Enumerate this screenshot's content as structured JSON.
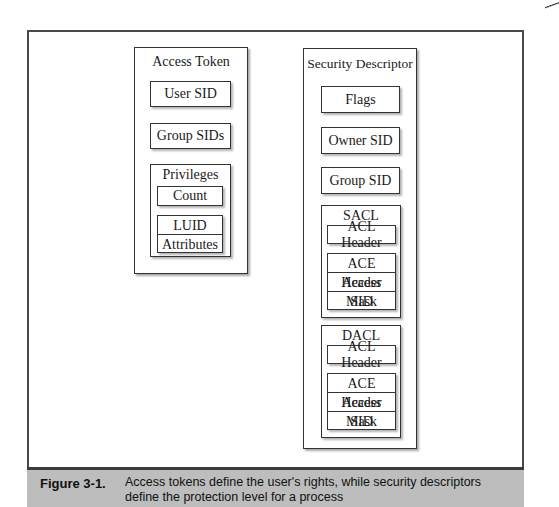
{
  "diagram": {
    "access_token": {
      "title": "Access Token",
      "user_sid": "User SID",
      "group_sids": "Group SIDs",
      "privileges": {
        "title": "Privileges",
        "count": "Count",
        "entry": [
          "LUID",
          "Attributes"
        ]
      }
    },
    "security_descriptor": {
      "title": "Security Descriptor",
      "flags": "Flags",
      "owner_sid": "Owner SID",
      "group_sid": "Group SID",
      "sacl": {
        "title": "SACL",
        "acl_header": "ACL Header",
        "ace": [
          "ACE Header",
          "Access Mask",
          "SID"
        ]
      },
      "dacl": {
        "title": "DACL",
        "acl_header": "ACL Header",
        "ace": [
          "ACE Header",
          "Access Mask",
          "SID"
        ]
      }
    }
  },
  "caption": {
    "label": "Figure 3-1.",
    "text": "Access tokens define the user's rights, while security descriptors define the protection level for a process"
  },
  "colors": {
    "caption_background": "#bdbdbd",
    "border": "#333333"
  }
}
